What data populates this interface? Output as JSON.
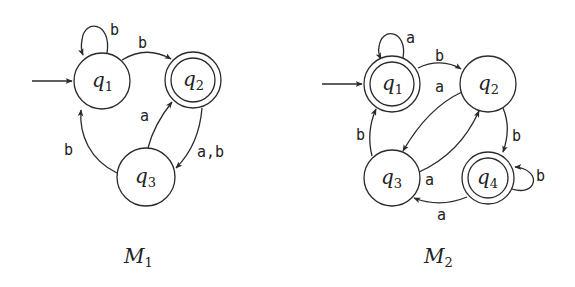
{
  "machines": [
    {
      "name": "M1",
      "label": {
        "base": "M",
        "sub": "1"
      },
      "start_state": "q1",
      "accept_states": [
        "q2"
      ],
      "states": [
        {
          "id": "q1",
          "base": "q",
          "sub": "1",
          "accepting": false,
          "start": true
        },
        {
          "id": "q2",
          "base": "q",
          "sub": "2",
          "accepting": true,
          "start": false
        },
        {
          "id": "q3",
          "base": "q",
          "sub": "3",
          "accepting": false,
          "start": false
        }
      ],
      "transitions": [
        {
          "from": "q1",
          "to": "q1",
          "label": "b"
        },
        {
          "from": "q1",
          "to": "q2",
          "label": "a"
        },
        {
          "from": "q2",
          "to": "q3",
          "label": "a,b"
        },
        {
          "from": "q3",
          "to": "q2",
          "label": "a"
        },
        {
          "from": "q3",
          "to": "q1",
          "label": "b"
        }
      ]
    },
    {
      "name": "M2",
      "label": {
        "base": "M",
        "sub": "2"
      },
      "start_state": "q1",
      "accept_states": [
        "q1",
        "q4"
      ],
      "states": [
        {
          "id": "q1",
          "base": "q",
          "sub": "1",
          "accepting": true,
          "start": true
        },
        {
          "id": "q2",
          "base": "q",
          "sub": "2",
          "accepting": false,
          "start": false
        },
        {
          "id": "q3",
          "base": "q",
          "sub": "3",
          "accepting": false,
          "start": false
        },
        {
          "id": "q4",
          "base": "q",
          "sub": "4",
          "accepting": true,
          "start": false
        }
      ],
      "transitions": [
        {
          "from": "q1",
          "to": "q1",
          "label": "a"
        },
        {
          "from": "q1",
          "to": "q2",
          "label": "b"
        },
        {
          "from": "q2",
          "to": "q3",
          "label": "a"
        },
        {
          "from": "q3",
          "to": "q2",
          "label": "a"
        },
        {
          "from": "q3",
          "to": "q1",
          "label": "b"
        },
        {
          "from": "q2",
          "to": "q4",
          "label": "b"
        },
        {
          "from": "q4",
          "to": "q4",
          "label": "b"
        },
        {
          "from": "q4",
          "to": "q3",
          "label": "a"
        }
      ]
    }
  ]
}
